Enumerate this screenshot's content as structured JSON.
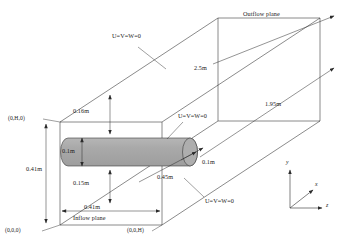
{
  "figure": {
    "colors": {
      "line": "#2b2b2b",
      "cylinder_fill": "#a8a8a8",
      "cylinder_stroke": "#3a3a3a",
      "background": "#ffffff",
      "text": "#1a1a1a"
    }
  },
  "planes": {
    "inflow_label": "Inflow plane",
    "outflow_label": "Outflow plane"
  },
  "boundary_conditions": {
    "top_wall": "U=V=W=0",
    "cylinder": "U=V=W=0",
    "bottom_wall": "U=V=W=0"
  },
  "dimensions": {
    "offset_top": "0.16m",
    "cylinder_diameter": "0.1m",
    "domain_height": "0.41m",
    "offset_bottom": "0.15m",
    "domain_width": "0.41m",
    "cylinder_length": "0.45m",
    "cylinder_end_diameter": "0.1m",
    "length_upstream": "2.5m",
    "length_downstream": "1.95m"
  },
  "coordinates": {
    "origin": "(0,0,0)",
    "top_left": "(0,H,0)",
    "bottom_right": "(0,0,H)"
  },
  "axes": {
    "y": "y",
    "x": "x",
    "z": "z"
  }
}
